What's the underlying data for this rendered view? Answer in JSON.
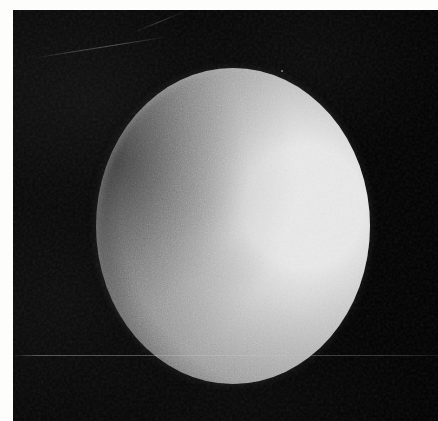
{
  "image": {
    "kind": "astronomical-photograph",
    "subject": "planetary-disk-gibbous-phase",
    "caption": "",
    "alt_text": "Grainy black-and-white astronomical photograph of a bright, nearly full planetary disk against black sky, lit from the right with a soft terminator on the left limb"
  },
  "frame": {
    "width_px": 438,
    "height_px": 421,
    "margin_color": "#fdfdfb",
    "margin_top_px": 10,
    "margin_left_px": 13,
    "has_right_margin": false,
    "has_bottom_margin": false
  },
  "sky": {
    "label": "background-sky",
    "color": "#050505",
    "mottled": true
  },
  "disk": {
    "label": "planetary-disk",
    "phase": "gibbous",
    "illumination_direction": "right",
    "center_x_px": 233,
    "center_y_px": 226,
    "width_px": 274,
    "height_px": 316,
    "bounds": {
      "left_px": 96,
      "top_px": 68,
      "right_px": 370,
      "bottom_px": 384
    },
    "highlight_color": "#e6e6e6",
    "midtone_color": "#bdbdbd",
    "terminator_color": "#434343",
    "shadow_color": "#0c0c0c",
    "terminator_side": "left",
    "edge": "soft-feathered"
  },
  "artifacts": {
    "items": [
      {
        "name": "horizontal-scratch",
        "y_px": 355,
        "orientation": "horizontal",
        "spans_full_width": true
      },
      {
        "name": "diagonal-scratch",
        "x_px": 31,
        "y_px": 58,
        "orientation": "diagonal",
        "angle_deg": -9
      },
      {
        "name": "diagonal-scratch-secondary",
        "x_px": 133,
        "y_px": 32,
        "orientation": "diagonal",
        "angle_deg": -22
      },
      {
        "name": "dust-speck",
        "x_px": 281,
        "y_px": 70
      }
    ],
    "grain": {
      "present": true,
      "intensity": "heavy",
      "opacity": 0.42
    }
  }
}
